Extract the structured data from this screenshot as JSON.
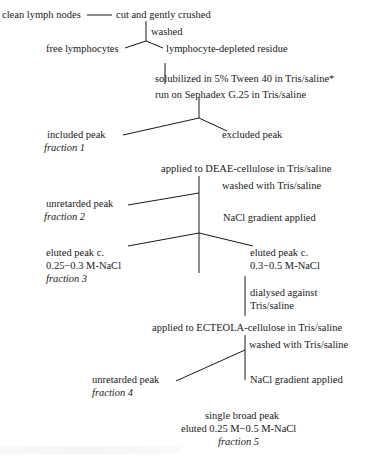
{
  "diagram": {
    "type": "flowchart",
    "nodes": {
      "clean_nodes": "clean lymph nodes",
      "cut": "cut and gently crushed",
      "washed": "washed",
      "free_lymph": "free lymphocytes",
      "residue": "lymphocyte-depleted residue",
      "solubilized": "solubilized in 5% Tween 40 in Tris/saline*",
      "sephadex": "run on Sephadex G.25 in Tris/saline",
      "included_peak": "included peak",
      "fraction1": "fraction 1",
      "excluded_peak": "excluded peak",
      "deae": "applied to DEAE-cellulose in Tris/saline",
      "deae_wash": "washed with Tris/saline",
      "unretarded2": "unretarded peak",
      "fraction2": "fraction 2",
      "deae_gradient": "NaCl gradient applied",
      "eluted3_a": "eluted peak c.",
      "eluted3_b": "0.25−0.3 M-NaCl",
      "fraction3": "fraction 3",
      "eluted_b_a": "eluted peak c.",
      "eluted_b_b": "0.3−0.5 M-NaCl",
      "dialysed_a": "dialysed against",
      "dialysed_b": "Tris/saline",
      "ecteola": "applied to ECTEOLA-cellulose in Tris/saline",
      "ect_wash": "washed with Tris/saline",
      "unretarded4": "unretarded peak",
      "fraction4": "fraction 4",
      "ect_gradient": "NaCl gradient applied",
      "single_a": "single broad peak",
      "single_b": "eluted 0.25 M−0.5 M-NaCl",
      "fraction5": "fraction 5"
    }
  }
}
